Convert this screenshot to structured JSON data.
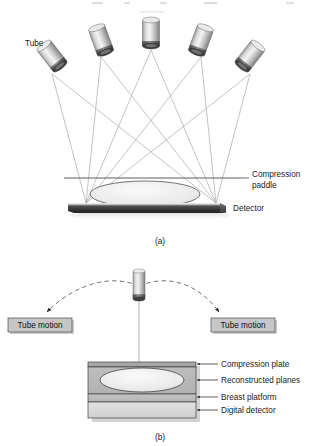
{
  "figure": {
    "panel_a": {
      "caption": "(a)",
      "labels": {
        "tube": "Tube",
        "compression_paddle_line1": "Compression",
        "compression_paddle_line2": "paddle",
        "detector": "Detector"
      },
      "tube_count": 5,
      "tubes": [
        {
          "cx": 52,
          "cy": 62,
          "angle": -38
        },
        {
          "cx": 101,
          "cy": 44,
          "angle": -20
        },
        {
          "cx": 151,
          "cy": 36,
          "angle": 0
        },
        {
          "cx": 201,
          "cy": 44,
          "angle": 20
        },
        {
          "cx": 250,
          "cy": 62,
          "angle": 38
        }
      ],
      "focus_points": [
        {
          "x": 86,
          "y": 203
        },
        {
          "x": 216,
          "y": 203
        }
      ],
      "paddle": {
        "x1": 64,
        "x2": 242,
        "y": 178
      },
      "detector_bar": {
        "x": 68,
        "y": 203,
        "width": 152,
        "height": 8
      },
      "breast": {
        "cx": 145,
        "cy": 194,
        "rx": 55,
        "ry": 13
      }
    },
    "panel_b": {
      "caption": "(b)",
      "labels": {
        "tube_motion_left": "Tube motion",
        "tube_motion_right": "Tube motion",
        "compression_plate": "Compression plate",
        "reconstructed_planes": "Reconstructed planes",
        "breast_platform": "Breast platform",
        "digital_detector": "Digital detector"
      },
      "tube": {
        "cx": 139,
        "cy": 285
      },
      "arc": {
        "left_end_x": 43,
        "right_end_x": 222,
        "apex_y": 278,
        "end_y": 316
      },
      "box": {
        "x": 88,
        "y": 362,
        "width": 108,
        "height": 56
      },
      "layers": [
        {
          "name": "compression-plate",
          "color": "#a8a8a8",
          "height": 5
        },
        {
          "name": "reconstructed-planes",
          "color": "#b9b9b9",
          "height": 27
        },
        {
          "name": "breast-platform",
          "color": "#bdbdbd",
          "height": 8
        },
        {
          "name": "digital-detector",
          "color": "#d6d6d6",
          "height": 14
        }
      ]
    },
    "colors": {
      "ray_line": "#9a9a9a",
      "tube_body_light": "#f2f2f2",
      "tube_body_mid": "#c8c8c8",
      "tube_body_dark": "#8d8d8d",
      "detector_dark": "#3a3a3a",
      "breast_fill": "#ededed",
      "box_fill": "#b5b5b5",
      "text": "#1a1a1a",
      "dashed_arc": "#6b6b6b"
    }
  }
}
